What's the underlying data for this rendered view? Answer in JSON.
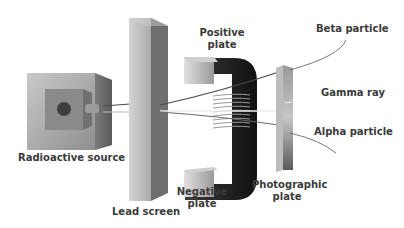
{
  "diagram": {
    "title": "",
    "labels": {
      "radioactive_source": "Radioactive source",
      "lead_screen": "Lead screen",
      "positive_plate_l1": "Positive",
      "positive_plate_l2": "plate",
      "negative_plate_l1": "Negative",
      "negative_plate_l2": "plate",
      "photographic_plate_l1": "Photographic",
      "photographic_plate_l2": "plate",
      "beta_particle": "Beta particle",
      "gamma_ray": "Gamma ray",
      "alpha_particle": "Alpha particle"
    },
    "components": [
      {
        "id": "radioactive-source",
        "shape": "box with circular source",
        "color": "#9a9a9a"
      },
      {
        "id": "lead-screen",
        "shape": "tall slab",
        "color": "#a8a8a8"
      },
      {
        "id": "electromagnet",
        "shape": "C-shaped core with coil",
        "color": "#2a2a2a"
      },
      {
        "id": "photographic-plate",
        "shape": "thin vertical plate",
        "color": "#888888"
      }
    ],
    "beams": [
      {
        "name": "Beta particle",
        "deflection": "toward positive plate (up)"
      },
      {
        "name": "Gamma ray",
        "deflection": "none (straight)"
      },
      {
        "name": "Alpha particle",
        "deflection": "toward negative plate (down, slight)"
      }
    ]
  }
}
